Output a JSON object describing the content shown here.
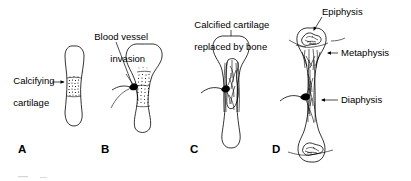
{
  "figure": {
    "background_color": "#ffffff",
    "ink_color": "#000000",
    "width": 411,
    "height": 181
  },
  "panels": [
    {
      "letter": "A",
      "letter_x": 18,
      "letter_y": 150,
      "labels": [
        {
          "name": "calcifying-cartilage",
          "text": "Calcifying\ncartilage",
          "x": 8,
          "y": 64,
          "align": "left"
        }
      ]
    },
    {
      "letter": "B",
      "letter_x": 101,
      "letter_y": 150,
      "labels": [
        {
          "name": "blood-vessel-invasion",
          "text": "Blood vessel\ninvasion",
          "x": 89,
          "y": 20,
          "align": "left"
        }
      ]
    },
    {
      "letter": "C",
      "letter_x": 190,
      "letter_y": 150,
      "labels": [
        {
          "name": "calcified-cartilage-replaced-by-bone",
          "text": "Calcified cartilage\nreplaced by bone",
          "x": 189,
          "y": 8,
          "align": "left"
        }
      ]
    },
    {
      "letter": "D",
      "letter_x": 272,
      "letter_y": 150,
      "labels": [
        {
          "name": "epiphysis",
          "text": "Epiphysis",
          "x": 322,
          "y": 9,
          "align": "left"
        },
        {
          "name": "metaphysis",
          "text": "Metaphysis",
          "x": 340,
          "y": 48,
          "align": "left"
        },
        {
          "name": "diaphysis",
          "text": "Diaphysis",
          "x": 340,
          "y": 95,
          "align": "left"
        }
      ]
    }
  ],
  "label_text": {
    "calcifying_cartilage_line1": "Calcifying",
    "calcifying_cartilage_line2": "cartilage",
    "blood_vessel_line1": "Blood vessel",
    "blood_vessel_line2": "invasion",
    "calcified_replaced_line1": "Calcified cartilage",
    "calcified_replaced_line2": "replaced by bone",
    "epiphysis": "Epiphysis",
    "metaphysis": "Metaphysis",
    "diaphysis": "Diaphysis",
    "letter_a": "A",
    "letter_b": "B",
    "letter_c": "C",
    "letter_d": "D"
  }
}
